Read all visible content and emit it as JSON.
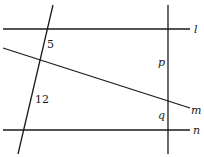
{
  "diagram": {
    "lines": {
      "l": "l",
      "m": "m",
      "n": "n"
    },
    "segment_labels": {
      "upper_left": "5",
      "lower_left": "12",
      "upper_right": "p",
      "lower_right": "q"
    }
  }
}
